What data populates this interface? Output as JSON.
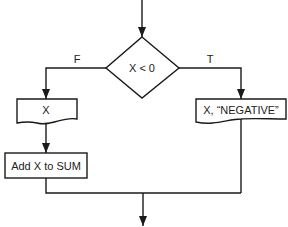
{
  "flowchart": {
    "decision": {
      "label": "X < 0"
    },
    "branches": {
      "false_label": "F",
      "true_label": "T"
    },
    "nodes": {
      "output_x": {
        "label": "X",
        "shape": "document"
      },
      "add_to_sum": {
        "label": "Add X to SUM",
        "shape": "process"
      },
      "output_negative": {
        "label": "X, “NEGATIVE”",
        "shape": "document"
      }
    },
    "colors": {
      "stroke": "#1a1a1a",
      "background": "#ffffff"
    }
  }
}
